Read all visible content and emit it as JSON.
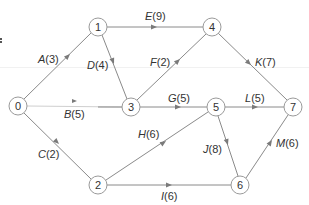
{
  "diagram": {
    "type": "activity-on-arrow network",
    "nodes": [
      {
        "id": "0",
        "label": "0",
        "x": 18,
        "y": 106
      },
      {
        "id": "1",
        "label": "1",
        "x": 98,
        "y": 27
      },
      {
        "id": "2",
        "label": "2",
        "x": 98,
        "y": 185
      },
      {
        "id": "3",
        "label": "3",
        "x": 131,
        "y": 107
      },
      {
        "id": "4",
        "label": "4",
        "x": 212,
        "y": 27
      },
      {
        "id": "5",
        "label": "5",
        "x": 216,
        "y": 107
      },
      {
        "id": "6",
        "label": "6",
        "x": 240,
        "y": 185
      },
      {
        "id": "7",
        "label": "7",
        "x": 293,
        "y": 107
      }
    ],
    "edges": [
      {
        "id": "A",
        "name": "A",
        "duration": "(3)",
        "from": "0",
        "to": "1"
      },
      {
        "id": "B",
        "name": "B",
        "duration": "(5)",
        "from": "0",
        "to": "3"
      },
      {
        "id": "C",
        "name": "C",
        "duration": "(2)",
        "from": "0",
        "to": "2"
      },
      {
        "id": "D",
        "name": "D",
        "duration": "(4)",
        "from": "1",
        "to": "3"
      },
      {
        "id": "E",
        "name": "E",
        "duration": "(9)",
        "from": "1",
        "to": "4"
      },
      {
        "id": "F",
        "name": "F",
        "duration": "(2)",
        "from": "3",
        "to": "4"
      },
      {
        "id": "G",
        "name": "G",
        "duration": "(5)",
        "from": "3",
        "to": "5"
      },
      {
        "id": "H",
        "name": "H",
        "duration": "(6)",
        "from": "2",
        "to": "5"
      },
      {
        "id": "I",
        "name": "I",
        "duration": "(6)",
        "from": "2",
        "to": "6"
      },
      {
        "id": "J",
        "name": "J",
        "duration": "(8)",
        "from": "5",
        "to": "6"
      },
      {
        "id": "K",
        "name": "K",
        "duration": "(7)",
        "from": "4",
        "to": "7"
      },
      {
        "id": "L",
        "name": "L",
        "duration": "(5)",
        "from": "5",
        "to": "7"
      },
      {
        "id": "M",
        "name": "M",
        "duration": "(6)",
        "from": "6",
        "to": "7"
      }
    ]
  },
  "colors": {
    "edge": "#8a8a8a",
    "node_stroke": "#9a9a9a",
    "text": "#333333",
    "background": "#ffffff"
  }
}
